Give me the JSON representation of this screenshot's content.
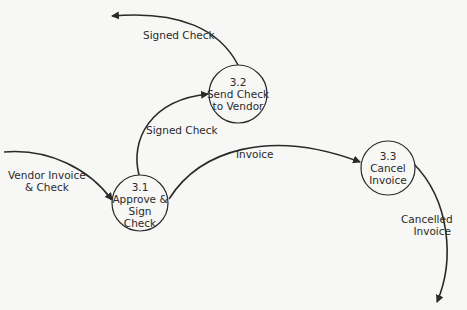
{
  "diagram": {
    "type": "data-flow-diagram",
    "processes": [
      {
        "id": "3.1",
        "number": "3.1",
        "lines": [
          "Approve &",
          "Sign",
          "Check"
        ]
      },
      {
        "id": "3.2",
        "number": "3.2",
        "lines": [
          "Send Check",
          "to Vendor"
        ]
      },
      {
        "id": "3.3",
        "number": "3.3",
        "lines": [
          "Cancel",
          "Invoice"
        ]
      }
    ],
    "flows": [
      {
        "label_lines": [
          "Vendor Invoice",
          "& Check"
        ],
        "from": "external",
        "to": "3.1"
      },
      {
        "label_lines": [
          "Signed Check"
        ],
        "from": "3.1",
        "to": "3.2"
      },
      {
        "label_lines": [
          "Signed Check"
        ],
        "from": "3.2",
        "to": "external"
      },
      {
        "label_lines": [
          "Invoice"
        ],
        "from": "3.1",
        "to": "3.3"
      },
      {
        "label_lines": [
          "Cancelled",
          "Invoice"
        ],
        "from": "3.3",
        "to": "external"
      }
    ]
  },
  "colors": {
    "line": "#2a2a2a",
    "background": "#f7f7f5"
  }
}
